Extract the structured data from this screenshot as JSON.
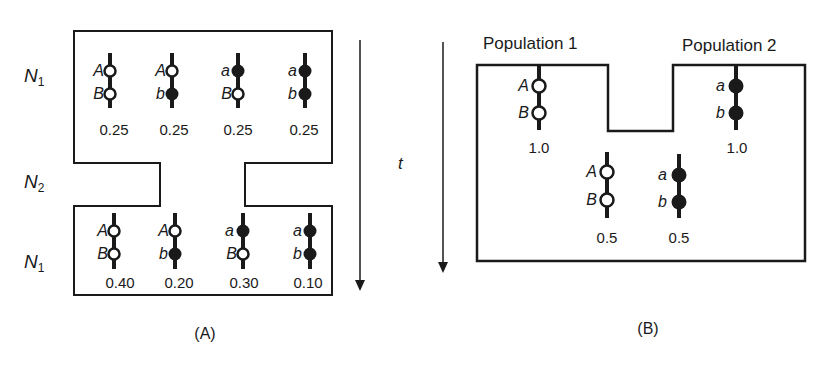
{
  "panel_a": {
    "caption": "(A)",
    "row_labels": [
      {
        "base": "N",
        "sub": "1"
      },
      {
        "base": "N",
        "sub": "2"
      },
      {
        "base": "N",
        "sub": "1"
      }
    ],
    "time_arrow_label": "t",
    "top_generation": [
      {
        "alleles": [
          "A",
          "B"
        ],
        "fill": [
          "open",
          "open"
        ],
        "frequency": "0.25"
      },
      {
        "alleles": [
          "A",
          "b"
        ],
        "fill": [
          "open",
          "filled"
        ],
        "frequency": "0.25"
      },
      {
        "alleles": [
          "a",
          "B"
        ],
        "fill": [
          "filled",
          "open"
        ],
        "frequency": "0.25"
      },
      {
        "alleles": [
          "a",
          "b"
        ],
        "fill": [
          "filled",
          "filled"
        ],
        "frequency": "0.25"
      }
    ],
    "bottom_generation": [
      {
        "alleles": [
          "A",
          "B"
        ],
        "fill": [
          "open",
          "open"
        ],
        "frequency": "0.40"
      },
      {
        "alleles": [
          "A",
          "b"
        ],
        "fill": [
          "open",
          "filled"
        ],
        "frequency": "0.20"
      },
      {
        "alleles": [
          "a",
          "B"
        ],
        "fill": [
          "filled",
          "open"
        ],
        "frequency": "0.30"
      },
      {
        "alleles": [
          "a",
          "b"
        ],
        "fill": [
          "filled",
          "filled"
        ],
        "frequency": "0.10"
      }
    ]
  },
  "panel_b": {
    "caption": "(B)",
    "population_1": {
      "title": "Population 1",
      "haplotype": {
        "alleles": [
          "A",
          "B"
        ],
        "fill": [
          "open",
          "open"
        ],
        "frequency": "1.0"
      }
    },
    "population_2": {
      "title": "Population 2",
      "haplotype": {
        "alleles": [
          "a",
          "b"
        ],
        "fill": [
          "filled",
          "filled"
        ],
        "frequency": "1.0"
      }
    },
    "admixed": [
      {
        "alleles": [
          "A",
          "B"
        ],
        "fill": [
          "open",
          "open"
        ],
        "frequency": "0.5"
      },
      {
        "alleles": [
          "a",
          "b"
        ],
        "fill": [
          "filled",
          "filled"
        ],
        "frequency": "0.5"
      }
    ]
  },
  "colors": {
    "ink": "#1a1a1a",
    "background": "#ffffff"
  }
}
